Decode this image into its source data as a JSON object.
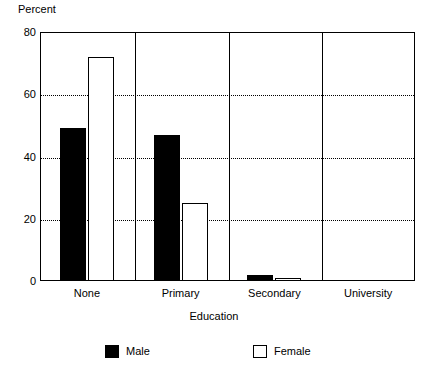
{
  "chart_data": {
    "type": "bar",
    "title": "",
    "xlabel": "Education",
    "ylabel": "Percent",
    "categories": [
      "None",
      "Primary",
      "Secondary",
      "University"
    ],
    "series": [
      {
        "name": "Male",
        "color": "#000000",
        "values": [
          49,
          47,
          2,
          0
        ]
      },
      {
        "name": "Female",
        "color": "#FFFFFF",
        "values": [
          72,
          25,
          1,
          0
        ]
      }
    ],
    "ylim": [
      0,
      80
    ],
    "yticks": [
      0,
      20,
      40,
      60,
      80
    ],
    "ytick_labels": [
      "0",
      "20",
      "40",
      "60",
      "80"
    ],
    "grid": "horizontal-dotted",
    "gridlines_at": [
      20,
      40,
      60
    ],
    "legend_position": "bottom",
    "legend_entries": [
      "Male",
      "Female"
    ],
    "axis_color": "#000000",
    "background": "#FFFFFF"
  }
}
